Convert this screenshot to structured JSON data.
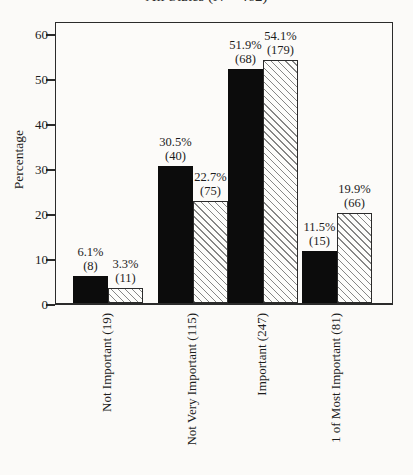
{
  "chart_data": {
    "type": "bar",
    "title": "All States (N = 462)",
    "title_note": "title is clipped at the top edge of the image; only the bottom sliver of the text line is visible",
    "ylabel": "Percentage",
    "xlabel": "",
    "ylim": [
      0,
      63
    ],
    "yticks": [
      0,
      10,
      20,
      30,
      40,
      50,
      60
    ],
    "grid": false,
    "legend": "none visible",
    "categories": [
      "Not Important (19)",
      "Not Very Important (115)",
      "Important (247)",
      "1 of Most Important (81)"
    ],
    "series": [
      {
        "name": "filled-black",
        "style": "solid",
        "color": "#0c0c0c",
        "values": [
          6.1,
          30.5,
          51.9,
          11.5
        ],
        "counts": [
          8,
          40,
          68,
          15
        ],
        "bar_labels": [
          [
            "6.1%",
            "(8)"
          ],
          [
            "30.5%",
            "(40)"
          ],
          [
            "51.9%",
            "(68)"
          ],
          [
            "11.5%",
            "(15)"
          ]
        ]
      },
      {
        "name": "hatched-diagonal",
        "style": "hatch",
        "hatch_direction": "backslash",
        "color": "#fdfdfb",
        "hatch_line_color": "#6e6e6e",
        "values": [
          3.3,
          22.7,
          54.1,
          19.9
        ],
        "counts": [
          11,
          75,
          179,
          66
        ],
        "bar_labels": [
          [
            "3.3%",
            "(11)"
          ],
          [
            "22.7%",
            "(75)"
          ],
          [
            "54.1%",
            "(179)"
          ],
          [
            "19.9%",
            "(66)"
          ]
        ]
      }
    ],
    "colors": {
      "axis": "#2b2b2b",
      "text": "#1c1c1c",
      "background": "#fbfaf8"
    }
  }
}
